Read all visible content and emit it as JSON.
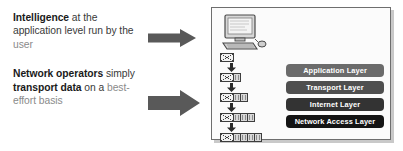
{
  "left": {
    "paragraphs": [
      {
        "id": "intelligence-statement",
        "segments": [
          {
            "text": "Intelligence",
            "style": "bold"
          },
          {
            "text": " at the application level run by the ",
            "style": "regular"
          },
          {
            "text": "user",
            "style": "gray"
          }
        ]
      },
      {
        "id": "network-operators-statement",
        "segments": [
          {
            "text": "Network operators",
            "style": "bold"
          },
          {
            "text": " simply ",
            "style": "regular"
          },
          {
            "text": "transport data",
            "style": "bold"
          },
          {
            "text": " on a ",
            "style": "regular"
          },
          {
            "text": "best-effort basis",
            "style": "gray"
          }
        ]
      }
    ]
  },
  "arrows": [
    {
      "name": "arrow-to-diagram-top",
      "direction": "right",
      "color": "#595959"
    },
    {
      "name": "arrow-to-diagram-bottom",
      "direction": "right",
      "color": "#595959"
    }
  ],
  "panel": {
    "computer_icon": "desktop-computer-icon",
    "encapsulation": {
      "label": "encapsulation-chain",
      "rows": [
        {
          "envelope": true,
          "headers": 0
        },
        {
          "envelope": true,
          "headers": 1
        },
        {
          "envelope": true,
          "headers": 2
        },
        {
          "envelope": true,
          "headers": 3
        },
        {
          "envelope": true,
          "headers": 4
        }
      ]
    },
    "layers": [
      {
        "label": "Application Layer",
        "color": "#6b6b6b"
      },
      {
        "label": "Transport Layer",
        "color": "#4f4f4f"
      },
      {
        "label": "Internet Layer",
        "color": "#333333"
      },
      {
        "label": "Network Access Layer",
        "color": "#141414"
      }
    ]
  }
}
